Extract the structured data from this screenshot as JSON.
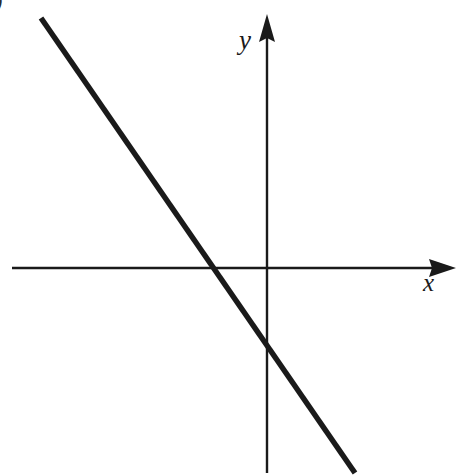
{
  "figure": {
    "part_label": ")",
    "background_color": "#ffffff",
    "stroke_color": "#1a1a1a",
    "width": 457,
    "height": 475
  },
  "axes": {
    "x": {
      "label": "x",
      "label_name": "x-axis-label",
      "line_start_x": 12,
      "line_end_x": 456,
      "line_y": 268,
      "stroke_width": 2.4,
      "arrow_at": "right",
      "arrow_tip_x": 456,
      "arrow_base_x": 430,
      "arrow_half_height": 9
    },
    "y": {
      "label": "y",
      "label_name": "y-axis-label",
      "line_x": 267,
      "line_start_y": 14,
      "line_end_y": 473,
      "stroke_width": 2.4,
      "arrow_at": "top",
      "arrow_tip_y": 14,
      "arrow_base_y": 41,
      "arrow_half_width": 8
    }
  },
  "chart_data": {
    "type": "line",
    "title": "",
    "subtitle": "",
    "xlabel": "x",
    "ylabel": "y",
    "grid": false,
    "legend": "none",
    "annotations": [],
    "tick_labels": {
      "x": [],
      "y": []
    },
    "axis_origin_px": {
      "x": 267,
      "y": 268
    },
    "series": [
      {
        "name": "decreasing-line",
        "kind": "straight-line",
        "description": "Straight line with negative slope crossing both axes",
        "stroke_color": "#1a1a1a",
        "stroke_width": 5.5,
        "endpoints_px": [
          {
            "x": 41,
            "y": 18
          },
          {
            "x": 355,
            "y": 473
          }
        ],
        "x_intercept_px": {
          "x": 215,
          "y": 268
        },
        "y_intercept_px": {
          "x": 267,
          "y": 340
        },
        "slope_px_per_px": -1.449,
        "slope_sign": "negative"
      }
    ]
  }
}
